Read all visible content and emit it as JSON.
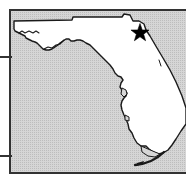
{
  "figure": {
    "kind": "locator-map",
    "subject": "Florida",
    "region_label": "Florida",
    "water_label": "Gulf of Mexico / Atlantic Ocean",
    "caption": "",
    "width": 186,
    "height": 180
  },
  "colors": {
    "land_fill": "#ffffff",
    "water_fill": "#d2d2d2",
    "water_stipple": "#b4b4b4",
    "outline": "#1a1a1a",
    "frame": "#333333",
    "marker": "#000000",
    "page_background": "#ffffff"
  },
  "frame": {
    "left": 10,
    "top": 10,
    "right": 186,
    "bottom": 173,
    "stroke_width": 2,
    "right_edge_open": true
  },
  "markers": [
    {
      "name": "star-marker",
      "shape": "star",
      "x": 140,
      "y": 33,
      "size": 19,
      "label": ""
    }
  ],
  "leader_lines": [
    {
      "name": "leader-line-upper",
      "x1": 0,
      "y1": 57,
      "x2": 12,
      "y2": 57
    },
    {
      "name": "leader-line-lower",
      "x1": 0,
      "y1": 156,
      "x2": 12,
      "y2": 156
    }
  ],
  "chart_data": {
    "type": "map",
    "title": "Florida",
    "xlabel": "",
    "ylabel": "",
    "projection": "unspecified",
    "features": [
      {
        "name": "florida-mainland",
        "type": "polygon",
        "fill": "land"
      },
      {
        "name": "florida-keys",
        "type": "polyline",
        "fill": "land"
      }
    ],
    "annotations": [
      {
        "type": "star",
        "x": 140,
        "y": 33,
        "text": ""
      }
    ]
  }
}
